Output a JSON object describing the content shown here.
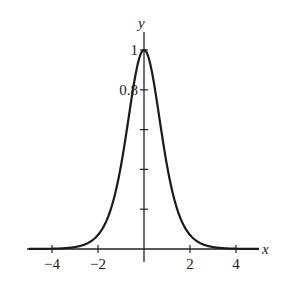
{
  "chart_data": {
    "type": "line",
    "title": "",
    "xlabel": "x",
    "ylabel": "y",
    "xlim": [
      -5,
      5
    ],
    "ylim": [
      0,
      1.05
    ],
    "x_ticks": [
      -4,
      -2,
      2,
      4
    ],
    "x_tick_labels": [
      "−4",
      "−2",
      "2",
      "4"
    ],
    "y_ticks": [
      0.2,
      0.4,
      0.6,
      0.8,
      1
    ],
    "y_tick_labels": [
      "",
      "",
      "",
      "0.8",
      "1"
    ],
    "grid": false,
    "legend": null,
    "series": [
      {
        "name": "y = sech^2(x)",
        "x": [
          -5,
          -4,
          -3,
          -2,
          -1.5,
          -1,
          -0.5,
          0,
          0.5,
          1,
          1.5,
          2,
          3,
          4,
          5
        ],
        "values": [
          0.0002,
          0.0013,
          0.0099,
          0.0707,
          0.1807,
          0.42,
          0.7864,
          1,
          0.7864,
          0.42,
          0.1807,
          0.0707,
          0.0099,
          0.0013,
          0.0002
        ]
      }
    ]
  }
}
